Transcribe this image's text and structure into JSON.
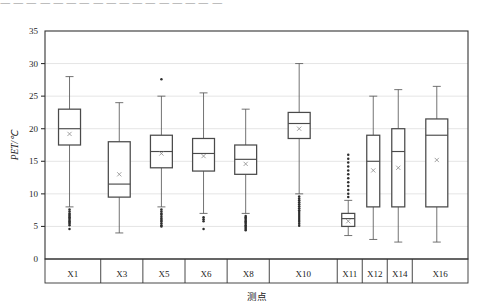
{
  "page": {
    "cut_top_text": "一 一 一 一 一 一 一 一 一 一 一 一 一 一 一 一 一"
  },
  "chart_data": {
    "type": "box",
    "title": "",
    "xlabel": "测点",
    "ylabel": "PET/℃",
    "ylim": [
      0,
      35
    ],
    "ytick_labels": [
      "0",
      "5",
      "10",
      "15",
      "20",
      "25",
      "30",
      "35"
    ],
    "ytick_values": [
      0,
      5,
      10,
      15,
      20,
      25,
      30,
      35
    ],
    "grid": true,
    "grid_axis": "y",
    "legend": "none",
    "categories": [
      "X1",
      "X3",
      "X5",
      "X6",
      "X8",
      "X10",
      "X11",
      "X12",
      "X14",
      "X16"
    ],
    "boxes": [
      {
        "label": "X1",
        "whisker_low": 8.0,
        "q1": 17.5,
        "median": 20.0,
        "q3": 23.0,
        "whisker_high": 28.0,
        "mean": 19.2,
        "outliers": [
          7.6,
          7.3,
          7.0,
          6.8,
          6.6,
          6.4,
          6.2,
          6.0,
          5.8,
          5.6,
          5.4,
          5.2,
          4.6
        ]
      },
      {
        "label": "X3",
        "whisker_low": 4.0,
        "q1": 9.5,
        "median": 11.5,
        "q3": 18.0,
        "whisker_high": 24.0,
        "mean": 13.0,
        "outliers": []
      },
      {
        "label": "X5",
        "whisker_low": 8.0,
        "q1": 14.0,
        "median": 16.5,
        "q3": 19.0,
        "whisker_high": 25.0,
        "mean": 16.2,
        "outliers": [
          27.6,
          7.6,
          7.3,
          7.0,
          6.8,
          6.5,
          6.2,
          6.0,
          5.8,
          5.5,
          5.2,
          5.0
        ]
      },
      {
        "label": "X6",
        "whisker_low": 7.0,
        "q1": 13.5,
        "median": 16.2,
        "q3": 18.5,
        "whisker_high": 25.5,
        "mean": 15.8,
        "outliers": [
          6.4,
          6.1,
          5.8,
          4.6
        ]
      },
      {
        "label": "X8",
        "whisker_low": 7.0,
        "q1": 13.0,
        "median": 15.3,
        "q3": 17.5,
        "whisker_high": 23.0,
        "mean": 14.6,
        "outliers": [
          6.6,
          6.4,
          6.2,
          6.0,
          5.8,
          5.6,
          5.4,
          5.2,
          5.0,
          4.8,
          4.6,
          4.4
        ]
      },
      {
        "label": "X10",
        "whisker_low": 10.0,
        "q1": 18.5,
        "median": 20.8,
        "q3": 22.5,
        "whisker_high": 30.0,
        "mean": 20.0,
        "outliers": [
          9.6,
          9.3,
          9.0,
          8.7,
          8.4,
          8.1,
          7.8,
          7.5,
          7.2,
          6.9,
          6.6,
          6.3,
          6.0,
          5.7,
          5.4,
          5.1
        ]
      },
      {
        "label": "X11",
        "whisker_low": 3.6,
        "q1": 5.0,
        "median": 6.2,
        "q3": 7.0,
        "whisker_high": 9.0,
        "mean": 5.8,
        "outliers": [
          16.0,
          15.4,
          14.8,
          14.2,
          13.6,
          13.0,
          12.4,
          11.8,
          11.2,
          10.6,
          10.0,
          9.5
        ]
      },
      {
        "label": "X12",
        "whisker_low": 3.0,
        "q1": 8.0,
        "median": 15.0,
        "q3": 19.0,
        "whisker_high": 25.0,
        "mean": 13.6,
        "outliers": []
      },
      {
        "label": "X14",
        "whisker_low": 2.6,
        "q1": 8.0,
        "median": 16.5,
        "q3": 20.0,
        "whisker_high": 26.0,
        "mean": 14.0,
        "outliers": []
      },
      {
        "label": "X16",
        "whisker_low": 2.6,
        "q1": 8.0,
        "median": 19.0,
        "q3": 21.5,
        "whisker_high": 26.5,
        "mean": 15.2,
        "outliers": []
      }
    ]
  }
}
